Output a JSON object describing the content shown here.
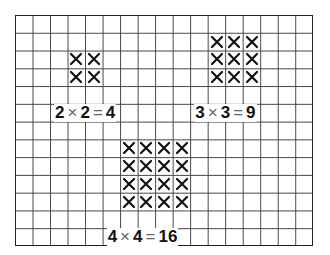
{
  "grid": {
    "columns": 17,
    "rows": 13,
    "cell_w": 17.53,
    "cell_h": 17.77,
    "left": 15,
    "top": 15
  },
  "groups": [
    {
      "name": "2x2",
      "col": 3,
      "row": 2,
      "n": 2,
      "label": {
        "a": "2",
        "times": "×",
        "b": "2",
        "eq": "=",
        "result": "4",
        "col": 2,
        "row": 5
      }
    },
    {
      "name": "3x3",
      "col": 11,
      "row": 1,
      "n": 3,
      "label": {
        "a": "3",
        "times": "×",
        "b": "3",
        "eq": "=",
        "result": "9",
        "col": 10,
        "row": 5
      }
    },
    {
      "name": "4x4",
      "col": 6,
      "row": 7,
      "n": 4,
      "label": {
        "a": "4",
        "times": "×",
        "b": "4",
        "eq": "=",
        "result": "16",
        "col": 5,
        "row": 12
      }
    }
  ],
  "cross_color": "#111111"
}
